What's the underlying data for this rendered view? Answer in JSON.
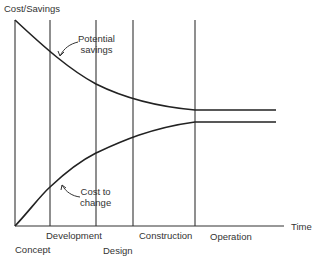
{
  "diagram": {
    "y_axis_label": "Cost/Savings",
    "x_axis_label": "Time",
    "phases": [
      "Concept",
      "Development",
      "Design",
      "Construction",
      "Operation"
    ],
    "curves": [
      {
        "name": "Potential savings",
        "label_line1": "Potential",
        "label_line2": "savings",
        "trend": "decreasing, levels off at Construction"
      },
      {
        "name": "Cost to change",
        "label_line1": "Cost  to",
        "label_line2": "change",
        "trend": "increasing, levels off at Construction"
      }
    ]
  }
}
